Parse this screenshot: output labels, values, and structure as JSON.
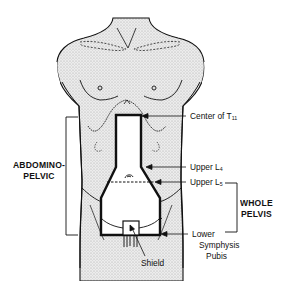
{
  "diagram": {
    "labels": {
      "center_t11": {
        "text": "Center of T",
        "sub": "11"
      },
      "upper_l4": {
        "text": "Upper L",
        "sub": "4"
      },
      "upper_l5": {
        "text": "Upper L",
        "sub": "5"
      },
      "lower_symphysis_line1": "Lower",
      "lower_symphysis_line2": "Symphysis",
      "lower_symphysis_line3": "Pubis",
      "shield": "Shield",
      "abdominopelvic_line1": "ABDOMINO-",
      "abdominopelvic_line2": "PELVIC",
      "whole_pelvis_line1": "WHOLE",
      "whole_pelvis_line2": "PELVIS"
    },
    "colors": {
      "line": "#111111",
      "body_fill": "#e4e4e4",
      "background": "#ffffff"
    }
  }
}
